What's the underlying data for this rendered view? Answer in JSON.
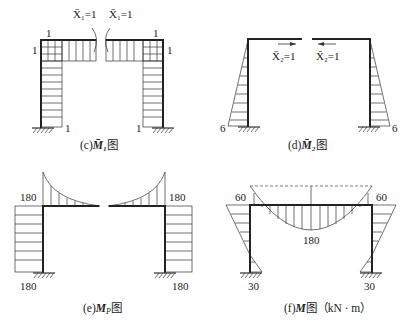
{
  "panels": {
    "c": {
      "caption_prefix": "(c)",
      "caption_symbol": "M̄₁",
      "caption_suffix": "图",
      "load_left": "X̄₁=1",
      "load_right": "X̄₁=1",
      "values": {
        "top_left_corner": "1",
        "top_right_corner": "1",
        "left_side": "1",
        "right_side": "1",
        "base_left": "1",
        "base_right": "1"
      }
    },
    "d": {
      "caption_prefix": "(d)",
      "caption_symbol": "M̄₂",
      "caption_suffix": "图",
      "load_left": "X̄₂=1",
      "load_right": "X̄₂=1",
      "values": {
        "base_left": "6",
        "base_right": "6"
      }
    },
    "e": {
      "caption_prefix": "(e)",
      "caption_symbol": "M",
      "caption_sub": "P",
      "caption_suffix": "图",
      "values": {
        "top_left": "180",
        "top_right": "180",
        "base_left": "180",
        "base_right": "180"
      }
    },
    "f": {
      "caption_prefix": "(f)",
      "caption_symbol": "M",
      "caption_suffix": "图（kN · m）",
      "values": {
        "corner_left": "60",
        "corner_right": "60",
        "midspan": "180",
        "base_left": "30",
        "base_right": "30"
      }
    }
  }
}
